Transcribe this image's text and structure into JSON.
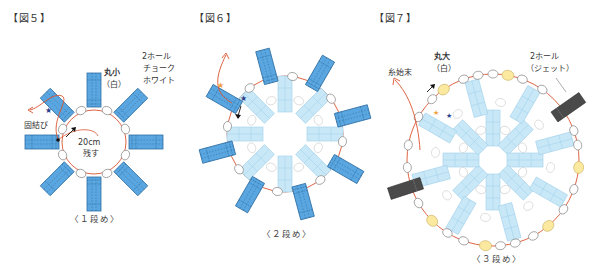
{
  "figures": [
    {
      "title": "【図５】",
      "caption": "〈１段め〉",
      "labels": {
        "bead_small": "丸小",
        "bead_small_color": "（白）",
        "two_hole": "2ホール",
        "two_hole_color1": "チョーク",
        "two_hole_color2": "ホワイト",
        "knot": "固結び",
        "leave_line1": "20cm",
        "leave_line2": "残す"
      }
    },
    {
      "title": "【図６】",
      "caption": "〈２段め〉"
    },
    {
      "title": "【図７】",
      "caption": "〈３段め〉",
      "labels": {
        "bead_large": "丸大",
        "bead_large_color": "（白）",
        "two_hole": "2ホール",
        "two_hole_color": "（ジェット）",
        "thread_end": "糸始末"
      }
    }
  ],
  "colors": {
    "bead_blue": "#5aa6e0",
    "bead_light_blue": "#c9e8f7",
    "thread_red": "#d9532f",
    "jet": "#4a4a4a",
    "yellow_bead": "#fbe9a0"
  }
}
